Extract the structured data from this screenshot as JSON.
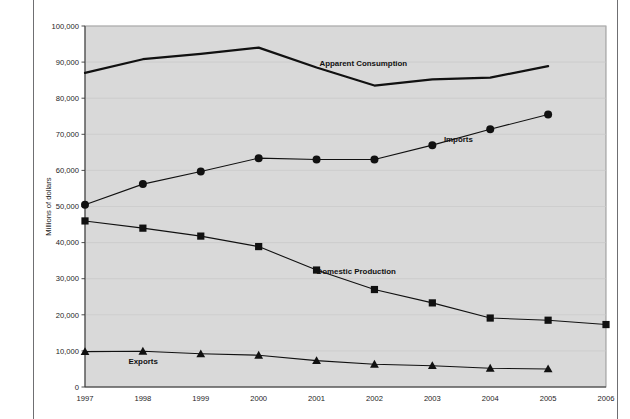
{
  "page": {
    "top_caption": "",
    "background_color": "#ffffff"
  },
  "figure": {
    "plot_background_color": "#d9d9d9",
    "plot_border_color": "#8c8c8c",
    "axis_color": "#3a3a3a",
    "gridline_color": "#c9c9c9",
    "series_color": "#111111"
  },
  "axes": {
    "y_title": "Millions of dollars",
    "y_ticks": [
      "0",
      "10,000",
      "20,000",
      "30,000",
      "40,000",
      "50,000",
      "60,000",
      "70,000",
      "80,000",
      "90,000",
      "100,000"
    ],
    "x_ticks": [
      "1997",
      "1998",
      "1999",
      "2000",
      "2001",
      "2002",
      "2003",
      "2004",
      "2005",
      "2006"
    ]
  },
  "labels": {
    "apparent_consumption": "Apparent Consumption",
    "imports": "Imports",
    "domestic_production": "Domestic Production",
    "exports": "Exports"
  },
  "chart_data": {
    "type": "line",
    "title": "",
    "xlabel": "",
    "ylabel": "Millions of dollars",
    "ylim": [
      0,
      100000
    ],
    "ytick_step": 10000,
    "grid": true,
    "legend_position": "inline-annotations",
    "x": [
      1997,
      1998,
      1999,
      2000,
      2001,
      2002,
      2003,
      2004,
      2005,
      2006
    ],
    "series": [
      {
        "name": "Apparent Consumption",
        "marker": "none",
        "line_width": 2.2,
        "x": [
          1997,
          1998,
          1999,
          2000,
          2001,
          2002,
          2003,
          2004,
          2005
        ],
        "values": [
          87000,
          90800,
          92300,
          94000,
          88500,
          83500,
          85200,
          85700,
          88900
        ]
      },
      {
        "name": "Imports",
        "marker": "circle",
        "line_width": 1.1,
        "x": [
          1997,
          1998,
          1999,
          2000,
          2001,
          2002,
          2003,
          2004,
          2005
        ],
        "values": [
          50500,
          56200,
          59700,
          63400,
          63000,
          63000,
          67000,
          71400,
          75500
        ]
      },
      {
        "name": "Domestic Production",
        "marker": "square",
        "line_width": 1.1,
        "x": [
          1997,
          1998,
          1999,
          2000,
          2001,
          2002,
          2003,
          2004,
          2005,
          2006
        ],
        "values": [
          46000,
          44000,
          41800,
          38900,
          32400,
          27000,
          23300,
          19100,
          18500,
          17300
        ]
      },
      {
        "name": "Exports",
        "marker": "triangle",
        "line_width": 1.1,
        "x": [
          1997,
          1998,
          1999,
          2000,
          2001,
          2002,
          2003,
          2004,
          2005
        ],
        "values": [
          9800,
          9900,
          9200,
          8800,
          7300,
          6300,
          5900,
          5200,
          5000
        ]
      }
    ],
    "annotations": [
      {
        "text": "Apparent Consumption",
        "x": 2001.05,
        "y": 88900
      },
      {
        "text": "Imports",
        "x": 2003.2,
        "y": 67800
      },
      {
        "text": "Domestic Production",
        "x": 2001.0,
        "y": 31200
      },
      {
        "text": "Exports",
        "x": 1997.75,
        "y": 6500
      }
    ]
  }
}
